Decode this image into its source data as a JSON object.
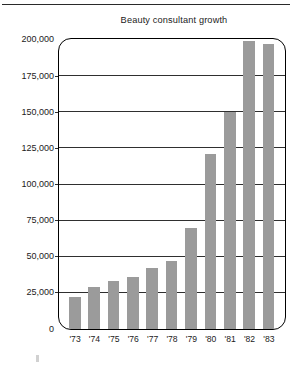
{
  "chart_data": {
    "type": "bar",
    "title": "Beauty consultant growth",
    "xlabel": "",
    "ylabel": "",
    "categories": [
      "'73",
      "'74",
      "'75",
      "'76",
      "'77",
      "'78",
      "'79",
      "'80",
      "'81",
      "'82",
      "'83"
    ],
    "values": [
      22000,
      29000,
      33000,
      36000,
      42000,
      47000,
      70000,
      121000,
      150000,
      199000,
      197000
    ],
    "ylim": [
      0,
      200000
    ],
    "ytick_values": [
      0,
      25000,
      50000,
      75000,
      100000,
      125000,
      150000,
      175000,
      200000
    ],
    "ytick_labels": [
      "0",
      "25,000",
      "50,000",
      "75,000",
      "100,000",
      "125,000",
      "150,000",
      "175,000",
      "200,000"
    ],
    "grid": true,
    "grid_axis": "y",
    "legend": null,
    "bar_color": "#9b9b9b",
    "frame_color": "#000000",
    "gridline_color": "#2f2f2f",
    "text_color": "#1b1b1b"
  }
}
